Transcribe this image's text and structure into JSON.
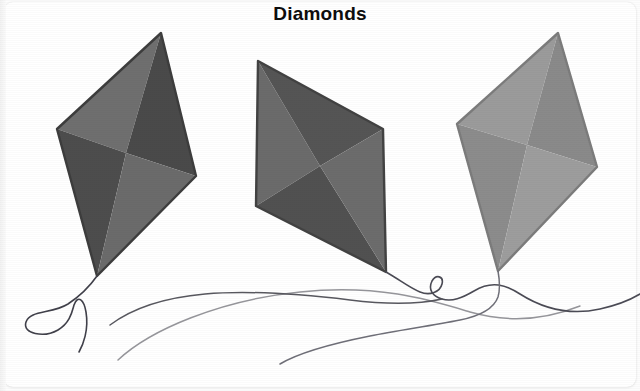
{
  "page": {
    "title": "Diamonds",
    "background_color": "#ffffff",
    "card_color": "#ffffff",
    "width": 640,
    "height": 391
  },
  "artwork": {
    "subject": "three diamond kites with trailing strings",
    "kite_count": 3,
    "kites": [
      {
        "name": "left-kite",
        "label": "Left diamond kite",
        "vertices": {
          "top": [
            161,
            33
          ],
          "left": [
            57,
            129
          ],
          "right": [
            196,
            176
          ],
          "bottom": [
            97,
            276
          ]
        },
        "center": [
          126,
          153
        ],
        "faces": {
          "top_left": "#6f6f6f",
          "top_right": "#4a4a4a",
          "bottom_left": "#4d4d4d",
          "bottom_right": "#6b6b6b"
        },
        "outline_color": "#3d3d3d"
      },
      {
        "name": "middle-kite",
        "label": "Middle diamond kite",
        "vertices": {
          "top": [
            258,
            61
          ],
          "left": [
            256,
            206
          ],
          "right": [
            383,
            129
          ],
          "bottom": [
            386,
            272
          ]
        },
        "center": [
          320,
          166
        ],
        "faces": {
          "top_left": "#6b6b6b",
          "top_right": "#555555",
          "bottom_left": "#515151",
          "bottom_right": "#6c6c6c"
        },
        "outline_color": "#424242"
      },
      {
        "name": "right-kite",
        "label": "Right diamond kite",
        "vertices": {
          "top": [
            558,
            33
          ],
          "left": [
            457,
            124
          ],
          "right": [
            597,
            167
          ],
          "bottom": [
            498,
            271
          ]
        },
        "center": [
          527,
          145
        ],
        "faces": {
          "top_left": "#9b9b9b",
          "top_right": "#8a8a8a",
          "bottom_left": "#8c8c8c",
          "bottom_right": "#9d9d9d"
        },
        "outline_color": "#7c7c7c"
      }
    ],
    "strings": [
      {
        "name": "left-kite-string",
        "color": "#3f3f3f",
        "width": 1.6,
        "description": "string from left kite tip curling into a loop at lower left"
      },
      {
        "name": "middle-kite-string",
        "color": "#4b4b4b",
        "width": 1.6,
        "description": "long string from middle kite tip with a small loop, sweeping left"
      },
      {
        "name": "right-kite-string",
        "color": "#6f6f6f",
        "width": 1.6,
        "description": "string from right kite tip sweeping right off the edge"
      },
      {
        "name": "lower-trailing-string",
        "color": "#8d8d8d",
        "width": 1.5,
        "description": "pale secondary string arcing across the lower area"
      }
    ]
  }
}
